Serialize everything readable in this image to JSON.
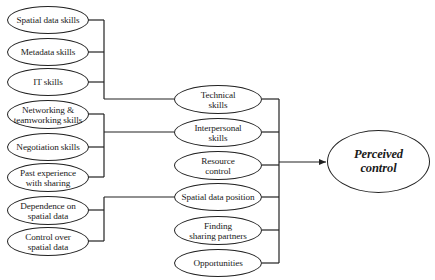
{
  "header_partial_text": "",
  "diagram": {
    "target": {
      "label": "Perceived\ncontrol"
    },
    "factors": [
      {
        "label": "Technical\nskills"
      },
      {
        "label": "Interpersonal\nskills"
      },
      {
        "label": "Resource\ncontrol"
      },
      {
        "label": "Spatial data position"
      },
      {
        "label": "Finding\nsharing partners"
      },
      {
        "label": "Opportunities"
      }
    ],
    "subfactors": [
      {
        "label": "Spatial data skills",
        "parent": "Technical skills"
      },
      {
        "label": "Metadata skills",
        "parent": "Technical skills"
      },
      {
        "label": "IT skills",
        "parent": "Technical skills"
      },
      {
        "label": "Networking &\nteamworking skills",
        "parent": "Interpersonal skills"
      },
      {
        "label": "Negotiation skills",
        "parent": "Interpersonal skills"
      },
      {
        "label": "Past experience\nwith sharing",
        "parent": "Interpersonal skills"
      },
      {
        "label": "Dependence on\nspatial data",
        "parent": "Spatial data position"
      },
      {
        "label": "Control over\nspatial data",
        "parent": "Spatial data position"
      }
    ]
  },
  "colors": {
    "line": "#222222",
    "background": "#ffffff",
    "text": "#1a1a1a"
  }
}
